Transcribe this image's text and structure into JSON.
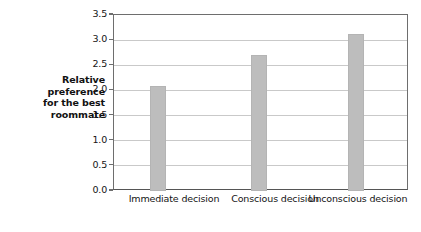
{
  "chart_data": {
    "type": "bar",
    "title": "",
    "subtitle": "",
    "xlabel": "",
    "ylabel": "Relative preference for the best roommate",
    "ylabel_lines": [
      "Relative",
      "preference",
      "for the best",
      "roommate"
    ],
    "categories": [
      "Immediate decision",
      "Conscious decision",
      "Unconscious decision"
    ],
    "values": [
      2.08,
      2.7,
      3.13
    ],
    "ylim": [
      0.0,
      3.5
    ],
    "yticks": [
      0.0,
      0.5,
      1.0,
      1.5,
      2.0,
      2.5,
      3.0,
      3.5
    ],
    "ytick_labels": [
      "0.0",
      "0.5",
      "1.0",
      "1.5",
      "2.0",
      "2.5",
      "3.0",
      "3.5"
    ],
    "grid": true,
    "grid_axis": "y",
    "legend": false,
    "legend_position": "none",
    "bar_color": "#bdbdbd",
    "grid_color": "#c9c9c9",
    "axis_color": "#6e6e6e",
    "background_color": "#ffffff",
    "text_color": "#141414"
  }
}
